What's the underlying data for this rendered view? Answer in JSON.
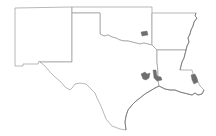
{
  "map": {
    "type": "choropleth-outline",
    "region": "South Central United States",
    "states": [
      {
        "id": "NM",
        "name": "New Mexico"
      },
      {
        "id": "OK",
        "name": "Oklahoma"
      },
      {
        "id": "AR",
        "name": "Arkansas"
      },
      {
        "id": "TX",
        "name": "Texas"
      },
      {
        "id": "LA",
        "name": "Louisiana"
      }
    ],
    "highlighted_areas": [
      {
        "id": "ok-central",
        "state": "OK",
        "description": "central Oklahoma county area"
      },
      {
        "id": "tx-houston-west",
        "state": "TX",
        "description": "southeast Texas area west"
      },
      {
        "id": "tx-houston-east",
        "state": "TX",
        "description": "southeast Texas area east"
      },
      {
        "id": "la-southeast",
        "state": "LA",
        "description": "southeast Louisiana area"
      }
    ],
    "colors": {
      "background": "#ffffff",
      "state_fill": "#ffffff",
      "border": "#9a9a9a",
      "highlight": "#6e6e6e"
    }
  }
}
